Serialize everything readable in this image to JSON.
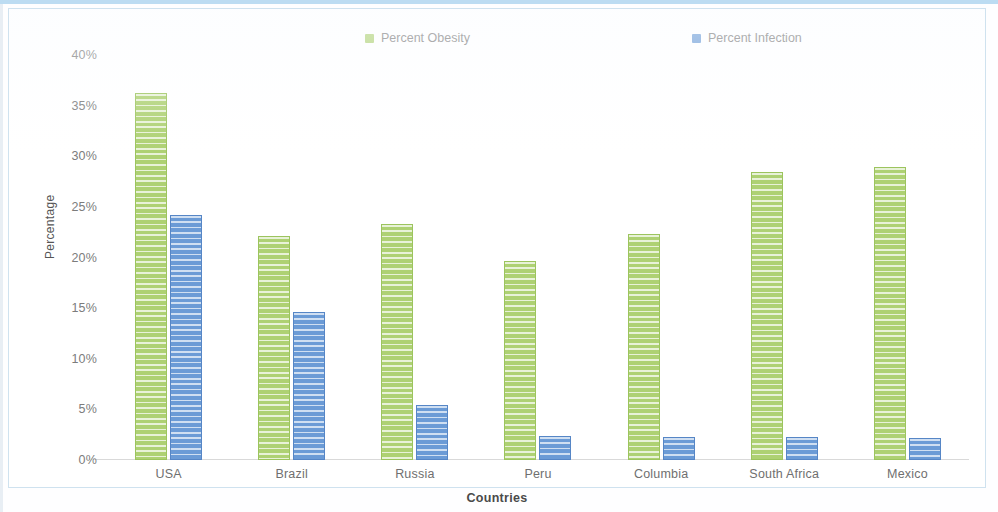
{
  "chart_data": {
    "type": "bar",
    "title": "",
    "xlabel": "Countries",
    "ylabel": "Percentage",
    "categories": [
      "USA",
      "Brazil",
      "Russia",
      "Peru",
      "Columbia",
      "South Africa",
      "Mexico"
    ],
    "series": [
      {
        "name": "Percent Obesity",
        "color": "#aed173",
        "values": [
          36.2,
          22.1,
          23.3,
          19.7,
          22.3,
          28.4,
          28.9
        ]
      },
      {
        "name": "Percent Infection",
        "color": "#6b9bd6",
        "values": [
          24.2,
          14.6,
          5.4,
          2.4,
          2.3,
          2.3,
          2.2
        ]
      }
    ],
    "ylim": [
      0,
      40
    ],
    "ytick_labels": [
      "40%",
      "35%",
      "30%",
      "25%",
      "20%",
      "15%",
      "10%",
      "5%",
      "0%"
    ],
    "ytick_values": [
      40,
      35,
      30,
      25,
      20,
      15,
      10,
      5,
      0
    ],
    "grid": false,
    "legend_position": "top"
  }
}
